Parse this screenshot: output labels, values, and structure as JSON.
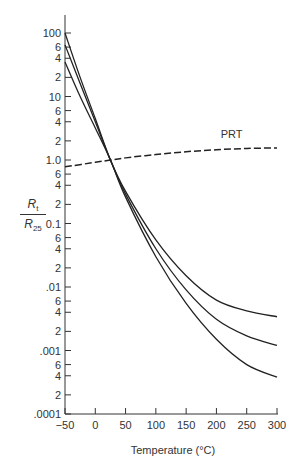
{
  "chart_data": {
    "type": "line",
    "title": "",
    "xlabel": "Temperature (°C)",
    "ylabel": "R_t / R_25",
    "ylabel_parts": {
      "num": "R",
      "num_sub": "t",
      "den": "R",
      "den_sub": "25"
    },
    "xlim": [
      -50,
      300
    ],
    "ylim": [
      0.0001,
      200
    ],
    "yscale": "log",
    "grid": false,
    "x_ticks": [
      -50,
      0,
      50,
      100,
      150,
      200,
      250,
      300
    ],
    "x_tick_labels": [
      "−50",
      "0",
      "50",
      "100",
      "150",
      "200",
      "250",
      "300"
    ],
    "y_major_ticks": [
      {
        "value": 100,
        "label": "100"
      },
      {
        "value": 10,
        "label": "10"
      },
      {
        "value": 1,
        "label": "1.0"
      },
      {
        "value": 0.1,
        "label": "0.1"
      },
      {
        "value": 0.01,
        "label": ".01"
      },
      {
        "value": 0.001,
        "label": ".001"
      },
      {
        "value": 0.0001,
        "label": ".0001"
      }
    ],
    "y_minor_tick_labels": [
      "6",
      "4",
      "2"
    ],
    "series": [
      {
        "name": "NTC thermistor A",
        "style": "solid",
        "x": [
          -50,
          -25,
          0,
          25,
          50,
          100,
          150,
          200,
          250,
          300
        ],
        "y": [
          100,
          20,
          4.5,
          1.0,
          0.32,
          0.055,
          0.015,
          0.0062,
          0.0042,
          0.0034
        ]
      },
      {
        "name": "NTC thermistor B",
        "style": "solid",
        "x": [
          -50,
          -25,
          0,
          25,
          50,
          100,
          150,
          200,
          250,
          300
        ],
        "y": [
          65,
          16,
          4.0,
          1.0,
          0.29,
          0.04,
          0.009,
          0.0031,
          0.0017,
          0.0012
        ]
      },
      {
        "name": "NTC thermistor C",
        "style": "solid",
        "x": [
          -50,
          -25,
          0,
          25,
          50,
          100,
          150,
          200,
          250,
          300
        ],
        "y": [
          35,
          10,
          3.2,
          1.0,
          0.26,
          0.03,
          0.0055,
          0.0015,
          0.0006,
          0.00038
        ]
      },
      {
        "name": "PRT",
        "style": "dashed",
        "x": [
          -50,
          0,
          25,
          50,
          100,
          150,
          200,
          250,
          300
        ],
        "y": [
          0.78,
          0.92,
          1.0,
          1.08,
          1.22,
          1.35,
          1.45,
          1.52,
          1.55
        ]
      }
    ],
    "annotations": [
      {
        "text": "PRT",
        "x": 225,
        "y": 2.2
      }
    ]
  }
}
